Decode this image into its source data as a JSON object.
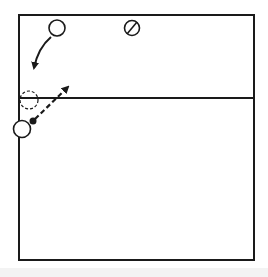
{
  "diagram": {
    "type": "volleyball-court-play-diagram",
    "colors": {
      "ink": "#1a1a1a",
      "paper": "#ffffff"
    },
    "court": {
      "left": 19,
      "top": 15,
      "right": 254,
      "bottom": 260,
      "net_y": 98
    },
    "players": [
      {
        "id": "player-top",
        "shape": "circle",
        "x": 57,
        "y": 28,
        "r": 8
      },
      {
        "id": "opponent-marked",
        "shape": "slashed-circle",
        "x": 132,
        "y": 28,
        "r": 8
      },
      {
        "id": "player-previous-position",
        "shape": "dashed-circle",
        "x": 29,
        "y": 100,
        "r": 9
      },
      {
        "id": "player-bottom",
        "shape": "circle",
        "x": 22,
        "y": 129,
        "r": 9
      }
    ],
    "ball": {
      "x": 33,
      "y": 121,
      "r": 3
    },
    "arrows": [
      {
        "id": "player-movement",
        "style": "solid-curved",
        "from": [
          51,
          37
        ],
        "to": [
          33,
          70
        ]
      },
      {
        "id": "ball-path",
        "style": "dashed",
        "from": [
          35,
          119
        ],
        "to": [
          70,
          85
        ]
      }
    ]
  }
}
